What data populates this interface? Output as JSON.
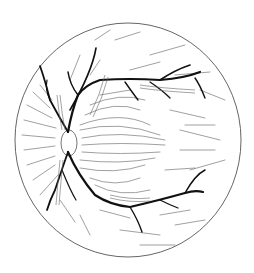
{
  "figure": {
    "caption": "Illustration of a retina showing optic disc, major blood vessels, and nerve fiber layer",
    "colors": {
      "background": "#ffffff",
      "outline": "#555555",
      "vessels": "#111111",
      "fibers": "#666666"
    }
  }
}
